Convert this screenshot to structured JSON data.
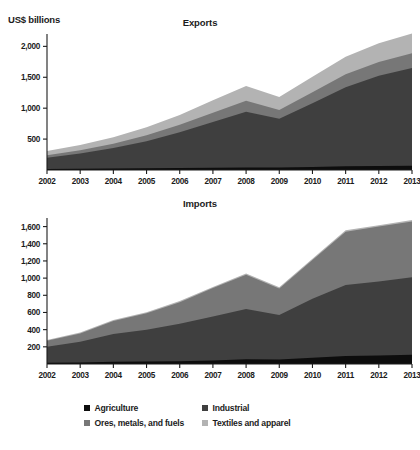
{
  "axis_unit_label": "US$ billions",
  "legend": {
    "items": [
      {
        "label": "Agriculture",
        "color": "#0d0d0d"
      },
      {
        "label": "Industrial",
        "color": "#3f3f3f"
      },
      {
        "label": "Ores, metals, and fuels",
        "color": "#777777"
      },
      {
        "label": "Textiles and apparel",
        "color": "#b3b3b3"
      }
    ]
  },
  "chart_data": [
    {
      "type": "area",
      "title": "Exports",
      "stacked": true,
      "xlabel": "",
      "ylabel": "US$ billions",
      "x": [
        2002,
        2003,
        2004,
        2005,
        2006,
        2007,
        2008,
        2009,
        2010,
        2011,
        2012,
        2013
      ],
      "xtick_labels": [
        "2002",
        "2003",
        "2004",
        "2005",
        "2006",
        "2007",
        "2008",
        "2009",
        "2010",
        "2011",
        "2012",
        "2013"
      ],
      "ytick_labels": [
        "500",
        "1,000",
        "1,500",
        "2,000"
      ],
      "yticks": [
        500,
        1000,
        1500,
        2000
      ],
      "ylim": [
        0,
        2200
      ],
      "grid": false,
      "legend_position": "bottom",
      "series": [
        {
          "name": "Agriculture",
          "color": "#0d0d0d",
          "values": [
            18,
            21,
            24,
            27,
            31,
            37,
            42,
            39,
            49,
            60,
            64,
            68
          ]
        },
        {
          "name": "Industrial",
          "color": "#3f3f3f",
          "values": [
            180,
            245,
            330,
            440,
            580,
            740,
            900,
            790,
            1030,
            1280,
            1460,
            1580
          ]
        },
        {
          "name": "Ores, metals, and fuels",
          "color": "#777777",
          "values": [
            40,
            52,
            72,
            95,
            120,
            150,
            180,
            140,
            180,
            210,
            225,
            240
          ]
        },
        {
          "name": "Textiles and apparel",
          "color": "#b3b3b3",
          "values": [
            70,
            88,
            105,
            130,
            160,
            200,
            235,
            210,
            250,
            280,
            300,
            320
          ]
        }
      ],
      "totals": [
        308,
        406,
        531,
        692,
        891,
        1127,
        1357,
        1179,
        1509,
        1830,
        2049,
        2208
      ]
    },
    {
      "type": "area",
      "title": "Imports",
      "stacked": true,
      "xlabel": "",
      "ylabel": "US$ billions",
      "x": [
        2002,
        2003,
        2004,
        2005,
        2006,
        2007,
        2008,
        2009,
        2010,
        2011,
        2012,
        2013
      ],
      "xtick_labels": [
        "2002",
        "2003",
        "2004",
        "2005",
        "2006",
        "2007",
        "2008",
        "2009",
        "2010",
        "2011",
        "2012",
        "2013"
      ],
      "ytick_labels": [
        "200",
        "400",
        "600",
        "800",
        "1,000",
        "1,200",
        "1,400",
        "1,600"
      ],
      "yticks": [
        200,
        400,
        600,
        800,
        1000,
        1200,
        1400,
        1600
      ],
      "ylim": [
        0,
        1700
      ],
      "grid": false,
      "legend_position": "bottom",
      "series": [
        {
          "name": "Agriculture",
          "color": "#0d0d0d",
          "values": [
            14,
            18,
            26,
            28,
            32,
            42,
            56,
            53,
            72,
            92,
            100,
            108
          ]
        },
        {
          "name": "Industrial",
          "color": "#3f3f3f",
          "values": [
            186,
            242,
            324,
            372,
            438,
            512,
            584,
            517,
            688,
            828,
            860,
            902
          ]
        },
        {
          "name": "Ores, metals, and fuels",
          "color": "#777777",
          "values": [
            70,
            96,
            150,
            190,
            250,
            330,
            400,
            310,
            450,
            620,
            640,
            650
          ]
        },
        {
          "name": "Textiles and apparel",
          "color": "#b3b3b3",
          "values": [
            10,
            11,
            12,
            12,
            13,
            14,
            15,
            13,
            15,
            16,
            17,
            18
          ]
        }
      ],
      "totals": [
        280,
        367,
        512,
        602,
        733,
        898,
        1055,
        893,
        1225,
        1556,
        1617,
        1678
      ]
    }
  ]
}
